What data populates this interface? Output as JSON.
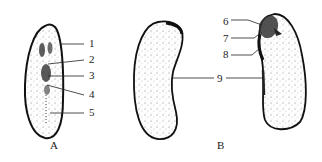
{
  "figure": {
    "panels": [
      {
        "id": "A",
        "caption": "A",
        "labels": [
          {
            "num": "1",
            "x": 89,
            "y": 47
          },
          {
            "num": "2",
            "x": 89,
            "y": 63
          },
          {
            "num": "3",
            "x": 89,
            "y": 79
          },
          {
            "num": "4",
            "x": 89,
            "y": 98
          },
          {
            "num": "5",
            "x": 89,
            "y": 116
          }
        ]
      },
      {
        "id": "B",
        "caption": "B",
        "labels": [
          {
            "num": "6",
            "x": 223,
            "y": 25
          },
          {
            "num": "7",
            "x": 223,
            "y": 42
          },
          {
            "num": "8",
            "x": 223,
            "y": 58
          },
          {
            "num": "9",
            "x": 217,
            "y": 82
          }
        ]
      }
    ],
    "colors": {
      "ink": "#222222",
      "stipple": "#555555",
      "background": "#ffffff"
    }
  }
}
